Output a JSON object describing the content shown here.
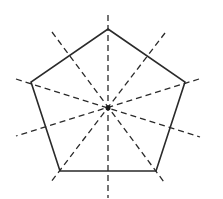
{
  "diagram": {
    "shape": "pentagon",
    "symmetry_line_count": 5,
    "colors": {
      "stroke": "#2a2a2a",
      "background": "#ffffff"
    },
    "vertices": [
      [
        108,
        29
      ],
      [
        185,
        82
      ],
      [
        156,
        171
      ],
      [
        60,
        171
      ],
      [
        31,
        82
      ]
    ],
    "center": [
      108,
      108
    ],
    "symmetry_lines": [
      {
        "from": [
          108,
          15
        ],
        "to": [
          108,
          198
        ]
      },
      {
        "from": [
          52,
          32
        ],
        "to": [
          164,
          182
        ]
      },
      {
        "from": [
          165,
          33
        ],
        "to": [
          51,
          182
        ]
      },
      {
        "from": [
          16,
          79
        ],
        "to": [
          200,
          137
        ]
      },
      {
        "from": [
          199,
          79
        ],
        "to": [
          16,
          136
        ]
      }
    ]
  }
}
